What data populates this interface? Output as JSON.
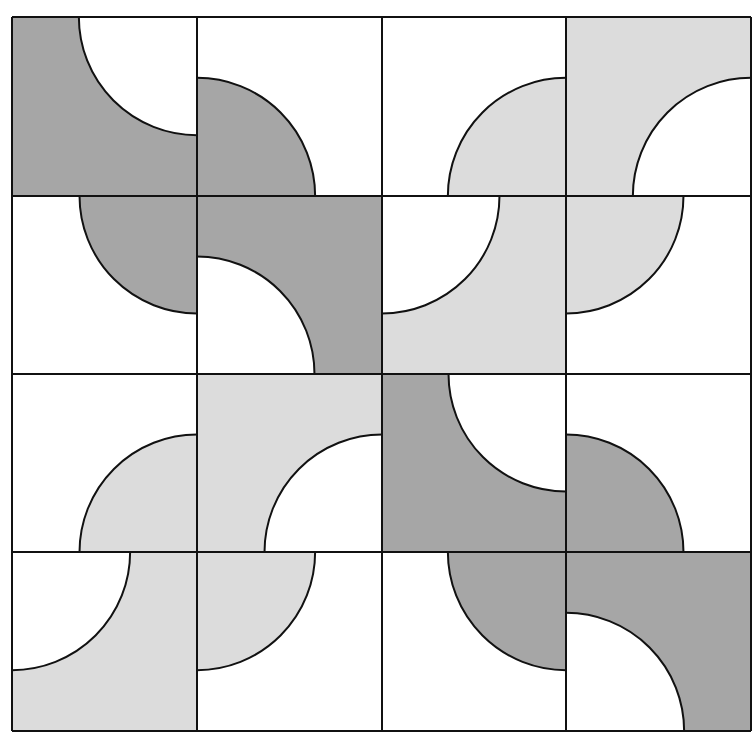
{
  "figure": {
    "type": "quarter-circle tile pattern",
    "grid": {
      "rows": 4,
      "cols": 4,
      "x_lines": [
        12,
        197,
        382,
        566,
        751
      ],
      "y_lines": [
        17,
        196,
        374,
        552,
        731
      ],
      "radius_ratio": 0.66
    },
    "colors": {
      "white": "#ffffff",
      "light": "#dcdcdc",
      "dark": "#a6a6a6",
      "stroke": "#111111"
    },
    "tiles": [
      {
        "row": 1,
        "col": 1,
        "background": "dark",
        "quarter": "white",
        "corner": "tr"
      },
      {
        "row": 1,
        "col": 2,
        "background": "white",
        "quarter": "dark",
        "corner": "bl"
      },
      {
        "row": 1,
        "col": 3,
        "background": "white",
        "quarter": "light",
        "corner": "br"
      },
      {
        "row": 1,
        "col": 4,
        "background": "light",
        "quarter": "white",
        "corner": "br"
      },
      {
        "row": 2,
        "col": 1,
        "background": "white",
        "quarter": "dark",
        "corner": "tr"
      },
      {
        "row": 2,
        "col": 2,
        "background": "dark",
        "quarter": "white",
        "corner": "bl"
      },
      {
        "row": 2,
        "col": 3,
        "background": "light",
        "quarter": "white",
        "corner": "tl"
      },
      {
        "row": 2,
        "col": 4,
        "background": "white",
        "quarter": "light",
        "corner": "tl"
      },
      {
        "row": 3,
        "col": 1,
        "background": "white",
        "quarter": "light",
        "corner": "br"
      },
      {
        "row": 3,
        "col": 2,
        "background": "light",
        "quarter": "white",
        "corner": "br"
      },
      {
        "row": 3,
        "col": 3,
        "background": "dark",
        "quarter": "white",
        "corner": "tr"
      },
      {
        "row": 3,
        "col": 4,
        "background": "white",
        "quarter": "dark",
        "corner": "bl"
      },
      {
        "row": 4,
        "col": 1,
        "background": "light",
        "quarter": "white",
        "corner": "tl"
      },
      {
        "row": 4,
        "col": 2,
        "background": "white",
        "quarter": "light",
        "corner": "tl"
      },
      {
        "row": 4,
        "col": 3,
        "background": "white",
        "quarter": "dark",
        "corner": "tr"
      },
      {
        "row": 4,
        "col": 4,
        "background": "dark",
        "quarter": "white",
        "corner": "bl"
      }
    ]
  }
}
